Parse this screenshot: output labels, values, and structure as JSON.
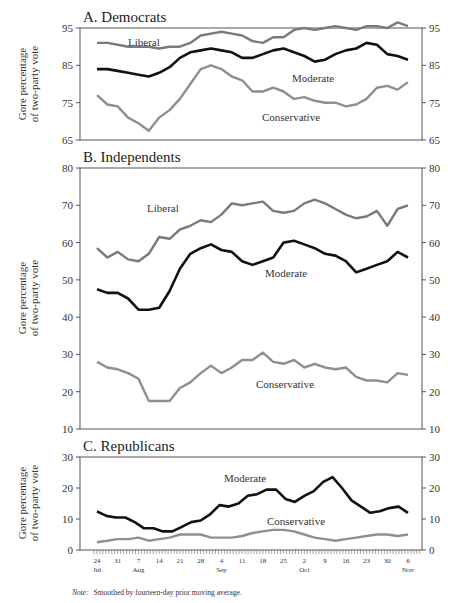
{
  "chart_data": [
    {
      "type": "line",
      "panel": "A",
      "title": "A. Democrats",
      "xlabel": "",
      "ylabel": "Gore percentage of two-party vote",
      "ylim": [
        65,
        95
      ],
      "yticks": [
        65,
        75,
        85,
        95
      ],
      "grid": false,
      "legend": "inline labels",
      "x_start": "Jul 24",
      "x_end": "Nov 6",
      "x_step_days": 3.5,
      "series": [
        {
          "name": "Liberal",
          "color": "#7a7a7a",
          "values": [
            91,
            91,
            90.5,
            90,
            90,
            90,
            89.5,
            90,
            90,
            91,
            93,
            93.5,
            94,
            93.5,
            93,
            91.5,
            91,
            92.5,
            92.5,
            94.5,
            95,
            94.5,
            95,
            95.5,
            95,
            94.5,
            95.5,
            95.5,
            95,
            96.5,
            95.5
          ]
        },
        {
          "name": "Moderate",
          "color": "#111111",
          "values": [
            84,
            84,
            83.5,
            83,
            82.5,
            82,
            83,
            84.5,
            87,
            88.5,
            89,
            89.5,
            89,
            88.5,
            87,
            87,
            88,
            89,
            89.5,
            88.5,
            87.5,
            86,
            86.5,
            88,
            89,
            89.5,
            91,
            90.5,
            88,
            87.5,
            86.5
          ]
        },
        {
          "name": "Conservative",
          "color": "#8f8f8f",
          "values": [
            77,
            74.5,
            74,
            71,
            69.5,
            67.5,
            71,
            73,
            76,
            80,
            84,
            85,
            84,
            82,
            81,
            78,
            78,
            79,
            78,
            76,
            76.5,
            75.5,
            75,
            75,
            74,
            74.5,
            76,
            79,
            79.5,
            78.5,
            80.5
          ]
        }
      ]
    },
    {
      "type": "line",
      "panel": "B",
      "title": "B. Independents",
      "xlabel": "",
      "ylabel": "Gore percentage of two-party vote",
      "ylim": [
        10,
        80
      ],
      "yticks": [
        10,
        20,
        30,
        40,
        50,
        60,
        70,
        80
      ],
      "grid": false,
      "legend": "inline labels",
      "x_start": "Jul 24",
      "x_end": "Nov 6",
      "x_step_days": 3.5,
      "series": [
        {
          "name": "Liberal",
          "color": "#7a7a7a",
          "values": [
            58.5,
            56,
            57.5,
            55.5,
            55,
            57,
            61.5,
            61,
            63.5,
            64.5,
            66,
            65.5,
            67.5,
            70.5,
            70,
            70.5,
            71,
            68.5,
            68,
            68.5,
            70.5,
            71.5,
            70.5,
            69,
            67.5,
            66.5,
            67,
            68.5,
            64.5,
            69,
            70
          ]
        },
        {
          "name": "Moderate",
          "color": "#111111",
          "values": [
            47.5,
            46.5,
            46.5,
            45,
            42,
            42,
            42.5,
            47,
            53,
            57,
            58.5,
            59.5,
            58,
            57.5,
            55,
            54,
            55,
            56,
            60,
            60.5,
            59.5,
            58.5,
            57,
            56.5,
            55,
            52,
            53,
            54,
            55,
            57.5,
            56
          ]
        },
        {
          "name": "Conservative",
          "color": "#8f8f8f",
          "values": [
            28,
            26.5,
            26,
            25,
            23.5,
            17.5,
            17.5,
            17.5,
            21,
            22.5,
            25,
            27,
            25,
            26.5,
            28.5,
            28.5,
            30.5,
            28,
            27.5,
            28.5,
            26.5,
            27.5,
            26.5,
            26,
            26.5,
            24,
            23,
            23,
            22.5,
            25,
            24.5
          ]
        }
      ]
    },
    {
      "type": "line",
      "panel": "C",
      "title": "C. Republicans",
      "xlabel": "",
      "ylabel": "Gore percentage of two-party vote",
      "ylim": [
        0,
        30
      ],
      "yticks": [
        0,
        10,
        20,
        30
      ],
      "grid": false,
      "legend": "inline labels",
      "x_start": "Jul 24",
      "x_end": "Nov 6",
      "x_step_days": 3.5,
      "x_ticks": [
        {
          "day": "24",
          "month": "Jul"
        },
        {
          "day": "31",
          "month": ""
        },
        {
          "day": "7",
          "month": "Aug"
        },
        {
          "day": "14",
          "month": ""
        },
        {
          "day": "21",
          "month": ""
        },
        {
          "day": "28",
          "month": ""
        },
        {
          "day": "4",
          "month": "Sep"
        },
        {
          "day": "11",
          "month": ""
        },
        {
          "day": "18",
          "month": ""
        },
        {
          "day": "25",
          "month": ""
        },
        {
          "day": "2",
          "month": "Oct"
        },
        {
          "day": "9",
          "month": ""
        },
        {
          "day": "16",
          "month": ""
        },
        {
          "day": "23",
          "month": ""
        },
        {
          "day": "30",
          "month": ""
        },
        {
          "day": "6",
          "month": "Nov"
        }
      ],
      "series": [
        {
          "name": "Moderate",
          "color": "#111111",
          "values": [
            12.5,
            11,
            10.5,
            10.5,
            9,
            7,
            7,
            6,
            6,
            7.5,
            9,
            9.5,
            11.5,
            14.5,
            14,
            15,
            17.5,
            18,
            19.5,
            19.5,
            16.5,
            15.5,
            17.5,
            19,
            22,
            23.5,
            20,
            16,
            14,
            12,
            12.5,
            13.5,
            14,
            12
          ]
        },
        {
          "name": "Conservative",
          "color": "#8f8f8f",
          "values": [
            2.5,
            3,
            3.5,
            3.5,
            4,
            3,
            3.5,
            4,
            5,
            5,
            5,
            4,
            4,
            4,
            4.5,
            5.5,
            6,
            6.5,
            6.5,
            6,
            5,
            4,
            3.5,
            3,
            3.5,
            4,
            4.5,
            5,
            5,
            4.5,
            5
          ]
        }
      ]
    }
  ],
  "axis_label_line1": "Gore percentage",
  "axis_label_line2": "of two-party vote",
  "note_prefix": "Note:",
  "note_text": "Smoothed by fourteen-day prior moving average."
}
